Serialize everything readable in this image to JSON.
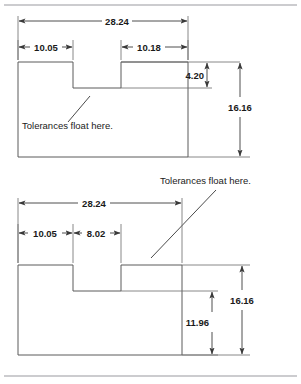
{
  "figure": {
    "title": "Tolerances float here.",
    "note_label": "Tolerances float here.",
    "units_implied": "mm"
  },
  "top_drawing": {
    "name": "top-part-view",
    "note": "Tolerances float here.",
    "dimensions": {
      "overall_width": "28.24",
      "left_segment": "10.05",
      "right_segment": "10.18",
      "notch_depth": "4.20",
      "overall_height": "16.16"
    }
  },
  "bottom_drawing": {
    "name": "bottom-part-view",
    "note": "Tolerances float here.",
    "dimensions": {
      "overall_width": "28.24",
      "left_segment": "10.05",
      "notch_width": "8.02",
      "lower_height": "11.96",
      "overall_height": "16.16"
    }
  },
  "colors": {
    "outline": "#5a5a5a",
    "dimension": "#3a3a3a",
    "text": "#1a1a1a",
    "frame": "#9a9aa0",
    "background": "#ffffff"
  }
}
